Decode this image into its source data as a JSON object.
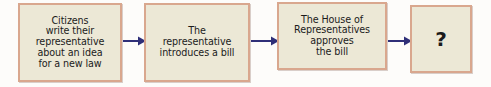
{
  "diagram": {
    "type": "horizontal-process-flow",
    "colors": {
      "box_fill": "#ece8d6",
      "box_border": "#d9a78e",
      "arrow": "#2f2f78",
      "text": "#1b1b1b",
      "background": "#fdfcfa"
    },
    "steps": [
      {
        "id": "step-1",
        "order": 1,
        "text": "Citizens write their representative about an idea for a new law",
        "lines": [
          "Citizens",
          "write their",
          "representative",
          "about an idea",
          "for a new law"
        ]
      },
      {
        "id": "step-2",
        "order": 2,
        "text": "The representative introduces a bill",
        "lines": [
          "The",
          "representative",
          "introduces a bill"
        ]
      },
      {
        "id": "step-3",
        "order": 3,
        "text": "The House of Representatives approves the bill",
        "lines": [
          "The House of",
          "Representatives",
          "approves",
          "the bill"
        ]
      },
      {
        "id": "step-4",
        "order": 4,
        "text": "?",
        "lines": [
          "?"
        ]
      }
    ],
    "connectors": [
      {
        "id": "arrow-1",
        "from": "step-1",
        "to": "step-2",
        "glyph": "right-arrow"
      },
      {
        "id": "arrow-2",
        "from": "step-2",
        "to": "step-3",
        "glyph": "right-arrow"
      },
      {
        "id": "arrow-3",
        "from": "step-3",
        "to": "step-4",
        "glyph": "right-arrow"
      }
    ]
  }
}
